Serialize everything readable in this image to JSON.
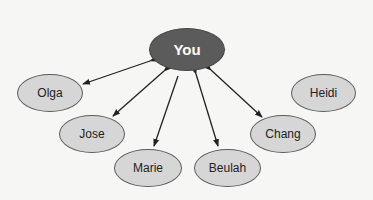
{
  "diagram": {
    "center": {
      "label": "You",
      "color": "#5b5b5b"
    },
    "nodes": [
      {
        "id": "olga",
        "label": "Olga",
        "connection": "bidirectional"
      },
      {
        "id": "jose",
        "label": "Jose",
        "connection": "bidirectional"
      },
      {
        "id": "marie",
        "label": "Marie",
        "connection": "from-you"
      },
      {
        "id": "beulah",
        "label": "Beulah",
        "connection": "bidirectional"
      },
      {
        "id": "chang",
        "label": "Chang",
        "connection": "bidirectional"
      },
      {
        "id": "heidi",
        "label": "Heidi",
        "connection": "none"
      }
    ],
    "node_fill": "#d6d6d6"
  }
}
